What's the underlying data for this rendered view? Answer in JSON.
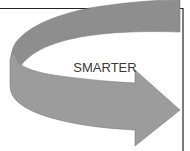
{
  "diagram": {
    "label": "SMARTER",
    "colors": {
      "arrow_fill": "#9a9a9a",
      "arrow_edge": "#7a7a7a",
      "frame": "#222222",
      "text": "#3a3a3a"
    }
  }
}
